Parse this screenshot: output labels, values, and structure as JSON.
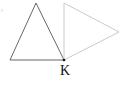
{
  "diagram": {
    "title": "",
    "point_label": "K",
    "colors": {
      "left_triangle_stroke": "#555555",
      "right_triangle_stroke": "#c4c4c4",
      "point_fill": "#111111",
      "background": "#ffffff"
    },
    "shapes": [
      {
        "name": "left-triangle",
        "points": [
          [
            36,
            3
          ],
          [
            10,
            60
          ],
          [
            64,
            60
          ]
        ]
      },
      {
        "name": "right-triangle",
        "points": [
          [
            64,
            3
          ],
          [
            119,
            32
          ],
          [
            64,
            60
          ]
        ]
      }
    ],
    "point_K": {
      "x": 64,
      "y": 60
    }
  }
}
